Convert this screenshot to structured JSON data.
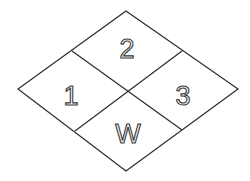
{
  "diagram": {
    "type": "hazard-diamond",
    "line_color": "#2b2b2b",
    "background": "#ffffff",
    "quadrants": {
      "left": {
        "label": "1"
      },
      "top": {
        "label": "2"
      },
      "right": {
        "label": "3"
      },
      "bottom": {
        "label": "W"
      }
    }
  }
}
